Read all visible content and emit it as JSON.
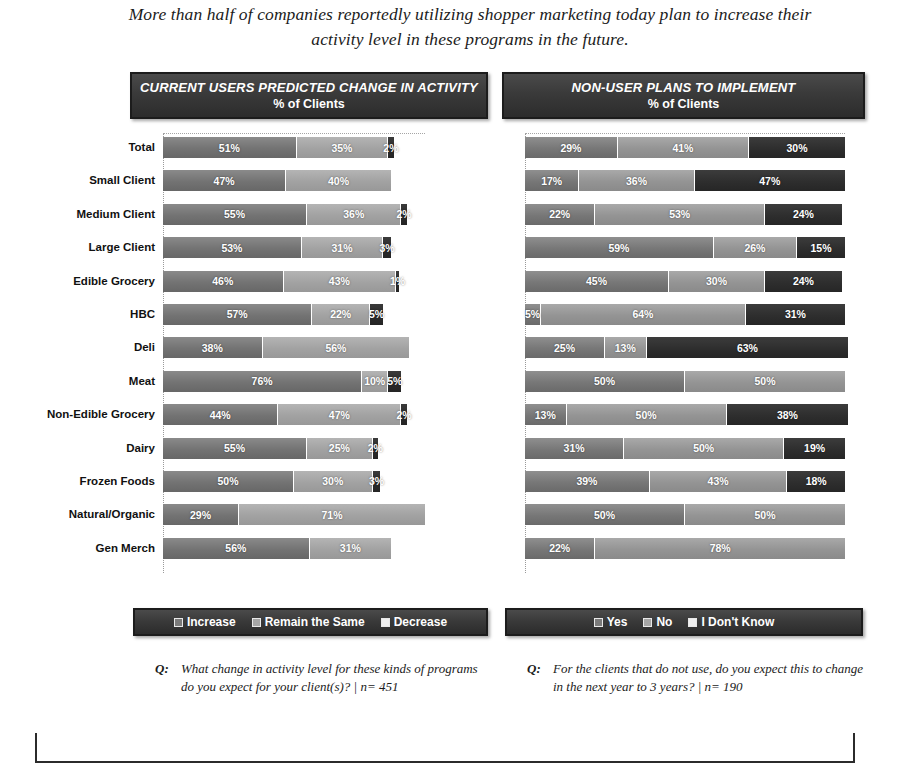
{
  "headline": "More than half of companies reportedly utilizing shopper marketing today plan to increase their activity level in these programs in the future.",
  "left_panel": {
    "title_line1": "CURRENT USERS PREDICTED CHANGE IN ACTIVITY",
    "title_line2": "% of Clients",
    "legend": [
      "Increase",
      "Remain the Same",
      "Decrease"
    ],
    "question_marker": "Q:",
    "question": "What change in activity level for these kinds of programs do you expect for your client(s)? | n= 451"
  },
  "right_panel": {
    "title_line1": "NON-USER PLANS TO IMPLEMENT",
    "title_line2": "% of Clients",
    "legend": [
      "Yes",
      "No",
      "I Don't Know"
    ],
    "question_marker": "Q:",
    "question": "For the clients that do not use, do you expect this to change in the next year to 3 years? | n= 190"
  },
  "chart_data": [
    {
      "type": "bar",
      "title": "CURRENT USERS PREDICTED CHANGE IN ACTIVITY",
      "subtitle": "% of Clients",
      "orientation": "horizontal",
      "stacked": true,
      "xlabel": "",
      "ylabel": "",
      "xlim": [
        0,
        100
      ],
      "grid": false,
      "legend_position": "bottom",
      "legend": [
        "Increase",
        "Remain the Same",
        "Decrease"
      ],
      "categories": [
        "Total",
        "Small Client",
        "Medium Client",
        "Large Client",
        "Edible Grocery",
        "HBC",
        "Deli",
        "Meat",
        "Non-Edible Grocery",
        "Dairy",
        "Frozen Foods",
        "Natural/Organic",
        "Gen Merch"
      ],
      "series": [
        {
          "name": "Increase",
          "values": [
            51,
            47,
            55,
            53,
            46,
            57,
            38,
            76,
            44,
            55,
            50,
            29,
            56
          ]
        },
        {
          "name": "Remain the Same",
          "values": [
            35,
            40,
            36,
            31,
            43,
            22,
            56,
            10,
            47,
            25,
            30,
            71,
            31
          ]
        },
        {
          "name": "Decrease",
          "values": [
            2,
            0,
            2,
            3,
            1,
            5,
            0,
            5,
            2,
            2,
            3,
            0,
            0
          ]
        }
      ],
      "labels": [
        [
          "51%",
          "35%",
          "2%"
        ],
        [
          "47%",
          "40%",
          ""
        ],
        [
          "55%",
          "36%",
          "2%"
        ],
        [
          "53%",
          "31%",
          "3%"
        ],
        [
          "46%",
          "43%",
          "1%"
        ],
        [
          "57%",
          "22%",
          "5%"
        ],
        [
          "38%",
          "56%",
          ""
        ],
        [
          "76%",
          "10%",
          "5%"
        ],
        [
          "44%",
          "47%",
          "2%"
        ],
        [
          "55%",
          "25%",
          "2%"
        ],
        [
          "50%",
          "30%",
          "3%"
        ],
        [
          "29%",
          "71%",
          ""
        ],
        [
          "56%",
          "31%",
          ""
        ]
      ],
      "note": "What change in activity level for these kinds of programs do you expect for your client(s)? | n= 451",
      "n": 451
    },
    {
      "type": "bar",
      "title": "NON-USER PLANS TO IMPLEMENT",
      "subtitle": "% of Clients",
      "orientation": "horizontal",
      "stacked": true,
      "xlabel": "",
      "ylabel": "",
      "xlim": [
        0,
        100
      ],
      "grid": false,
      "legend_position": "bottom",
      "legend": [
        "Yes",
        "No",
        "I Don't Know"
      ],
      "categories": [
        "Total",
        "Small Client",
        "Medium Client",
        "Large Client",
        "Edible Grocery",
        "HBC",
        "Deli",
        "Meat",
        "Non-Edible Grocery",
        "Dairy",
        "Frozen Foods",
        "Natural/Organic",
        "Gen Merch"
      ],
      "series": [
        {
          "name": "Yes",
          "values": [
            29,
            17,
            22,
            59,
            45,
            5,
            25,
            50,
            13,
            31,
            39,
            50,
            22
          ]
        },
        {
          "name": "No",
          "values": [
            41,
            36,
            53,
            26,
            30,
            64,
            13,
            50,
            50,
            50,
            43,
            50,
            78
          ]
        },
        {
          "name": "I Don't Know",
          "values": [
            30,
            47,
            24,
            15,
            24,
            31,
            63,
            0,
            38,
            19,
            18,
            0,
            0
          ]
        }
      ],
      "labels": [
        [
          "29%",
          "41%",
          "30%"
        ],
        [
          "17%",
          "36%",
          "47%"
        ],
        [
          "22%",
          "53%",
          "24%"
        ],
        [
          "59%",
          "26%",
          "15%"
        ],
        [
          "45%",
          "30%",
          "24%"
        ],
        [
          "5%",
          "64%",
          "31%"
        ],
        [
          "25%",
          "13%",
          "63%"
        ],
        [
          "50%",
          "50%",
          ""
        ],
        [
          "13%",
          "50%",
          "38%"
        ],
        [
          "31%",
          "50%",
          "19%"
        ],
        [
          "39%",
          "43%",
          "18%"
        ],
        [
          "50%",
          "50%",
          ""
        ],
        [
          "22%",
          "78%",
          ""
        ]
      ],
      "note": "For the clients that do not use, do you expect this to change in the next year to 3 years? | n= 190",
      "n": 190
    }
  ]
}
